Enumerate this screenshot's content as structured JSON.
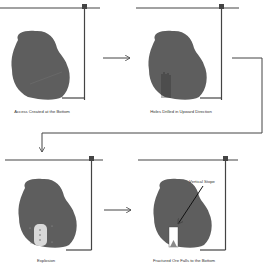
{
  "panels": [
    {
      "id": "p1",
      "label": "Access Created at the Bottom"
    },
    {
      "id": "p2",
      "label": "Holes Drilled in Upward Direction"
    },
    {
      "id": "p3",
      "label": "Explosion"
    },
    {
      "id": "p4",
      "label": "Fractured Ore Falls to the Bottom",
      "annotation": "Vertical Stope"
    }
  ],
  "colors": {
    "ore": "#5e5e5e",
    "line": "#444444",
    "background": "#ffffff",
    "stope": "#ffffff",
    "blast": "#d9d9d9"
  }
}
